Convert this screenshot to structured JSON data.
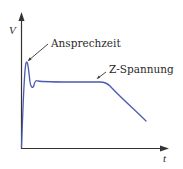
{
  "diagram": {
    "type": "voltage-time curve",
    "axes": {
      "y_label": "V",
      "x_label": "t"
    },
    "annotations": [
      {
        "id": "response-time",
        "text": "Ansprechzeit"
      },
      {
        "id": "zener-voltage",
        "text": "Z-Spannung"
      }
    ],
    "colors": {
      "curve": "#4a5bb0",
      "axis": "#333333",
      "text": "#2a2a2a"
    }
  }
}
